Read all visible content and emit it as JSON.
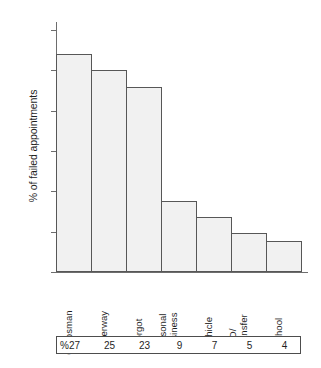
{
  "chart_data": {
    "type": "bar",
    "title": "",
    "xlabel": "",
    "ylabel": "% of failed appointments",
    "ylim": [
      0,
      31
    ],
    "grid": false,
    "legend": null,
    "yticks": [
      0,
      5,
      10,
      15,
      20,
      25,
      30
    ],
    "ytick_labels": [
      "0",
      "5",
      "10",
      "15",
      "20",
      "25",
      "30"
    ],
    "categories": [
      "Corpsman",
      "Underway",
      "Forgot",
      "Personal\nBusiness",
      "Vehicle",
      "TAD/\nTransfer",
      "School"
    ],
    "values": [
      27,
      25,
      23,
      8.8,
      6.8,
      4.8,
      3.8
    ],
    "data_label_prefix": "%",
    "data_labels": [
      "27",
      "25",
      "23",
      "9",
      "7",
      "5",
      "4"
    ],
    "bar_fill": "#f1f1f1",
    "bar_stroke": "#575757",
    "axis_color": "#6d6d6d"
  }
}
